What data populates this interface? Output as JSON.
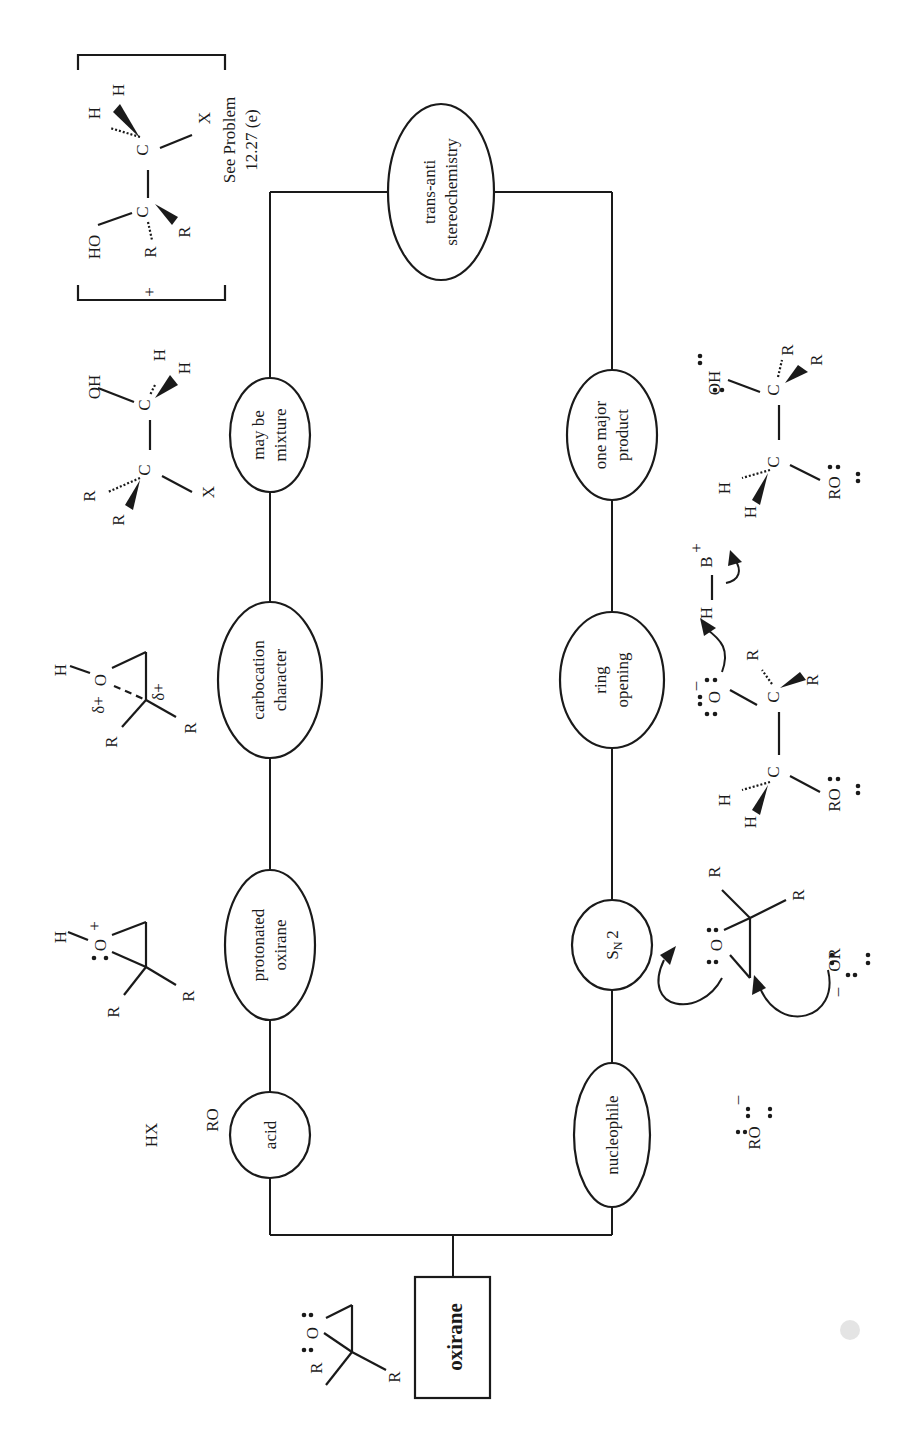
{
  "diagram": {
    "orientation": "rotated 90 degrees counter-clockwise",
    "root": {
      "label": "oxirane",
      "shape": "box"
    },
    "upper_path": {
      "reagent": "HX",
      "nodes": [
        {
          "id": "acid",
          "lines": [
            "acid"
          ]
        },
        {
          "id": "protonated-oxirane",
          "lines": [
            "protonated",
            "oxirane"
          ]
        },
        {
          "id": "carbocation-character",
          "lines": [
            "carbocation",
            "character"
          ]
        },
        {
          "id": "may-be-mixture",
          "lines": [
            "may be",
            "mixture"
          ]
        }
      ]
    },
    "lower_path": {
      "reagent": "RO∶⁻",
      "nodes": [
        {
          "id": "nucleophile",
          "lines": [
            "nucleophile"
          ]
        },
        {
          "id": "sn2",
          "lines": [
            "SN2"
          ],
          "main": "S",
          "sub": "N",
          "tail": "2"
        },
        {
          "id": "ring-opening",
          "lines": [
            "ring",
            "opening"
          ]
        },
        {
          "id": "one-major-product",
          "lines": [
            "one major",
            "product"
          ]
        }
      ]
    },
    "convergence_node": {
      "id": "trans-anti-stereochemistry",
      "lines": [
        "trans-anti",
        "stereochemistry"
      ]
    },
    "note": {
      "lines": [
        "See Problem",
        "12.27 (e)"
      ]
    },
    "atoms": {
      "R": "R",
      "O": "O",
      "H": "H",
      "C": "C",
      "X": "X",
      "OH": "OH",
      "HO": "HO",
      "RO": "RO",
      "OR": "OR",
      "B": "B",
      "plus": "+",
      "minus": "–",
      "delta_plus": "δ+"
    }
  }
}
